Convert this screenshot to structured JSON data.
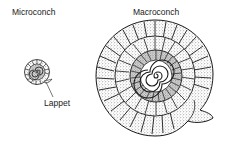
{
  "figure": {
    "labels": {
      "microconch": "Microconch",
      "macroconch": "Macroconch",
      "lappet": "Lappet"
    },
    "colors": {
      "ink": "#1a1a1a",
      "stipple": "#555555",
      "background": "#ffffff"
    }
  }
}
